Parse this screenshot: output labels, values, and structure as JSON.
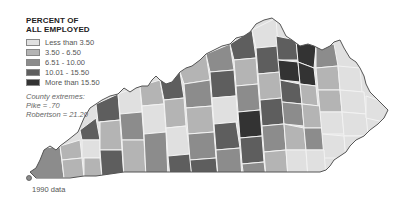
{
  "legend": {
    "title_line1": "PERCENT OF",
    "title_line2": "ALL EMPLOYED",
    "items": [
      {
        "label": "Less than 3.50",
        "color": "#e0e0e0"
      },
      {
        "label": "3.50 - 6.50",
        "color": "#b4b4b4"
      },
      {
        "label": "6.51 - 10.00",
        "color": "#8c8c8c"
      },
      {
        "label": "10.01 - 15.50",
        "color": "#5e5e5e"
      },
      {
        "label": "More than 15.50",
        "color": "#333333"
      }
    ]
  },
  "extremes": {
    "heading": "County extremes:",
    "min": "Pike = .70",
    "max": "Robertson = 21.20"
  },
  "footnote": "1990 data",
  "map": {
    "region": "Kentucky counties",
    "outline_color": "#555555",
    "county_border_color": "#f2f2f2"
  }
}
